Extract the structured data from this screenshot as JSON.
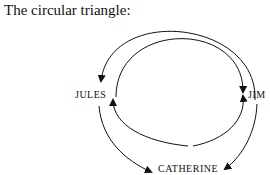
{
  "title": "The circular triangle:",
  "nodes": {
    "jules": "JULES",
    "jim": "JIM",
    "catherine": "CATHERINE"
  },
  "colors": {
    "ink": "#111111",
    "background": "#ffffff"
  }
}
